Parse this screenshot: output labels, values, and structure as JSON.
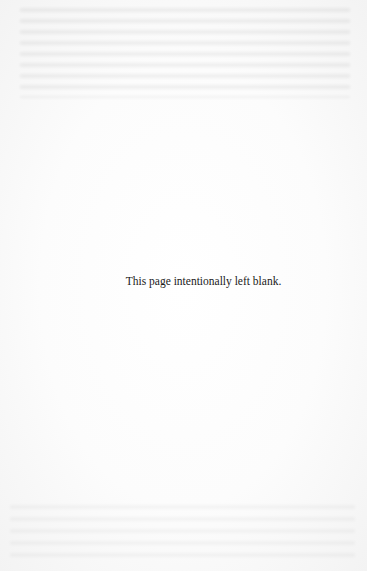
{
  "document": {
    "type": "scanned-book-page",
    "notice_text": "This page intentionally left blank."
  },
  "colors": {
    "page_background": "#fbfbfb",
    "text": "#1a1a1a"
  }
}
